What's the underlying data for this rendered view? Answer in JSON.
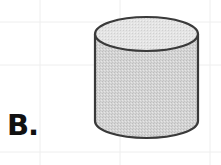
{
  "figure": {
    "label": "B.",
    "shape": "cylinder",
    "colors": {
      "fill": "#d2d2d2",
      "top_fill": "#e2e2e2",
      "stroke": "#3a3a3a",
      "grid": "#f0f0f0",
      "background": "#ffffff",
      "label": "#111111"
    }
  }
}
